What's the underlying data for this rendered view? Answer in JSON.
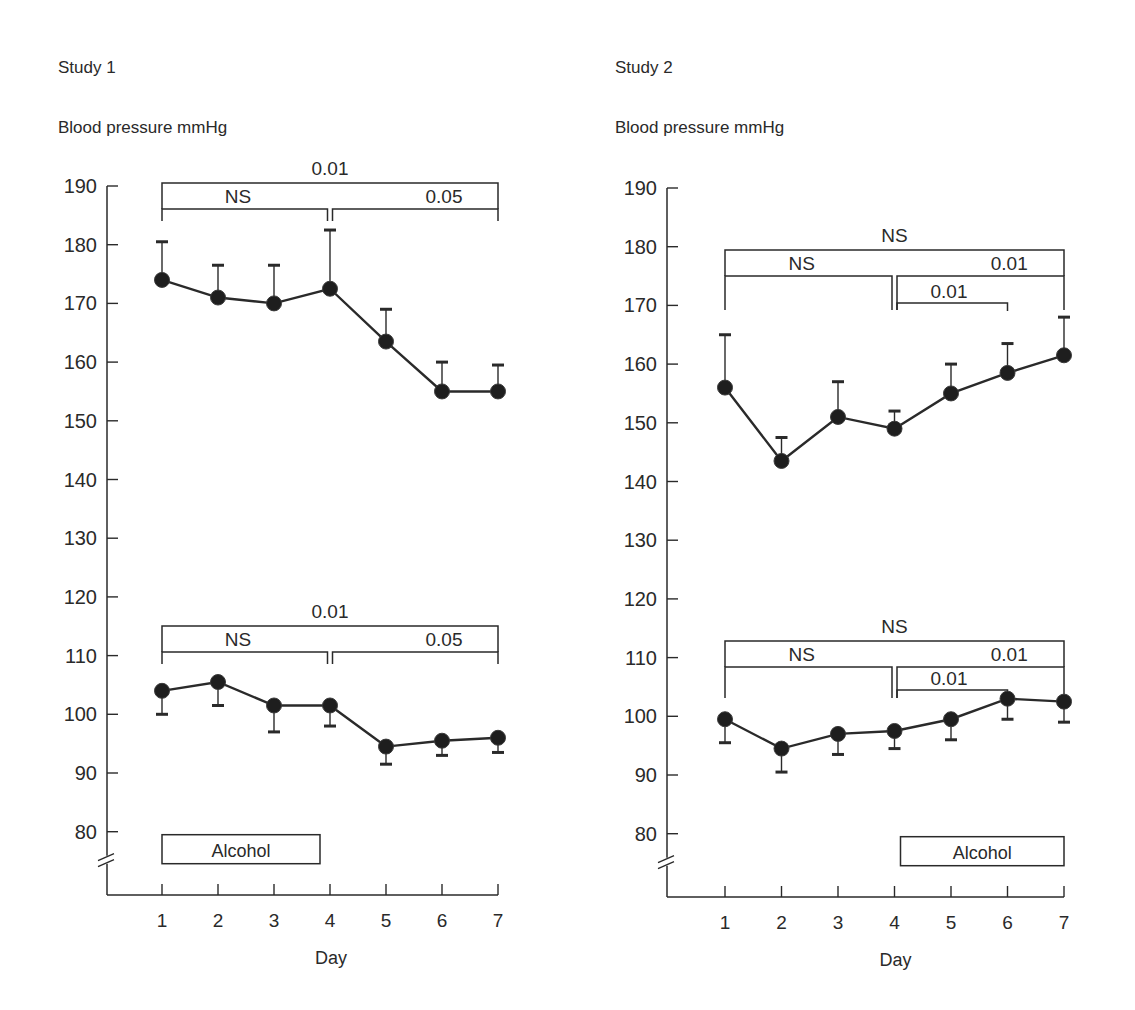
{
  "panels": [
    {
      "title": "Study 1",
      "ylabel": "Blood pressure mmHg",
      "xlabel": "Day",
      "alcohol_label": "Alcohol"
    },
    {
      "title": "Study 2",
      "ylabel": "Blood pressure mmHg",
      "xlabel": "Day",
      "alcohol_label": "Alcohol"
    }
  ],
  "chart_data": [
    {
      "type": "line",
      "title": "Study 1",
      "xlabel": "Day",
      "ylabel": "Blood pressure mmHg",
      "x": [
        1,
        2,
        3,
        4,
        5,
        6,
        7
      ],
      "ylim": [
        75,
        190
      ],
      "yticks": [
        80,
        90,
        100,
        110,
        120,
        130,
        140,
        150,
        160,
        170,
        180,
        190
      ],
      "axis_break": "below 80",
      "alcohol_period": [
        1,
        4
      ],
      "series": [
        {
          "name": "Systolic",
          "values": [
            174,
            171,
            170,
            172.5,
            163.5,
            155,
            155
          ],
          "error_upper": [
            180.5,
            176.5,
            176.5,
            182.5,
            169,
            160,
            159.5
          ]
        },
        {
          "name": "Diastolic",
          "values": [
            104,
            105.5,
            101.5,
            101.5,
            94.5,
            95.5,
            96
          ],
          "error_lower": [
            100,
            101.5,
            97,
            98,
            91.5,
            93,
            93.5
          ]
        }
      ],
      "significance": [
        {
          "series": "Systolic",
          "from": 1,
          "to": 7,
          "label": "0.01"
        },
        {
          "series": "Systolic",
          "from": 1,
          "to": 4,
          "label": "NS"
        },
        {
          "series": "Systolic",
          "from": 4,
          "to": 7,
          "label": "0.05"
        },
        {
          "series": "Diastolic",
          "from": 1,
          "to": 7,
          "label": "0.01"
        },
        {
          "series": "Diastolic",
          "from": 1,
          "to": 4,
          "label": "NS"
        },
        {
          "series": "Diastolic",
          "from": 4,
          "to": 7,
          "label": "0.05"
        }
      ]
    },
    {
      "type": "line",
      "title": "Study 2",
      "xlabel": "Day",
      "ylabel": "Blood pressure mmHg",
      "x": [
        1,
        2,
        3,
        4,
        5,
        6,
        7
      ],
      "ylim": [
        75,
        190
      ],
      "yticks": [
        80,
        90,
        100,
        110,
        120,
        130,
        140,
        150,
        160,
        170,
        180,
        190
      ],
      "axis_break": "below 80",
      "alcohol_period": [
        4,
        7
      ],
      "series": [
        {
          "name": "Systolic",
          "values": [
            156,
            143.5,
            151,
            149,
            155,
            158.5,
            161.5
          ],
          "error_upper": [
            165,
            147.5,
            157,
            152,
            160,
            163.5,
            168
          ]
        },
        {
          "name": "Diastolic",
          "values": [
            99.5,
            94.5,
            97,
            97.5,
            99.5,
            103,
            102.5
          ],
          "error_lower": [
            95.5,
            90.5,
            93.5,
            94.5,
            96,
            99.5,
            99
          ]
        }
      ],
      "significance": [
        {
          "series": "Systolic",
          "from": 1,
          "to": 7,
          "label": "NS"
        },
        {
          "series": "Systolic",
          "from": 1,
          "to": 4,
          "label": "NS"
        },
        {
          "series": "Systolic",
          "from": 4,
          "to": 7,
          "label": "0.01"
        },
        {
          "series": "Systolic",
          "from": 4,
          "to": 6,
          "label": "0.01"
        },
        {
          "series": "Diastolic",
          "from": 1,
          "to": 7,
          "label": "NS"
        },
        {
          "series": "Diastolic",
          "from": 1,
          "to": 4,
          "label": "NS"
        },
        {
          "series": "Diastolic",
          "from": 4,
          "to": 7,
          "label": "0.01"
        },
        {
          "series": "Diastolic",
          "from": 4,
          "to": 6,
          "label": "0.01"
        }
      ]
    }
  ]
}
